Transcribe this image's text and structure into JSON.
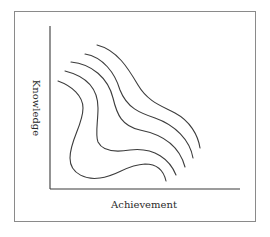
{
  "chart_data": {
    "type": "line",
    "title": "",
    "xlabel": "Achievement",
    "ylabel": "Knowledge",
    "grid": false,
    "legend": "none",
    "series": [
      {
        "name": "curve-1",
        "path": "M58,81 C72,86 83,96 83,108 C83,125 70,140 70,158 C70,175 88,180 100,178 C118,176 125,165 145,164 C158,164 164,172 166,181"
      },
      {
        "name": "curve-2",
        "path": "M65,71 C85,76 98,88 98,108 C98,122 95,135 98,142 C103,152 118,152 130,150 C155,147 170,160 176,175"
      },
      {
        "name": "curve-3",
        "path": "M71,62 C92,64 108,78 113,98 C117,115 122,126 140,130 C165,135 180,148 185,167"
      },
      {
        "name": "curve-4",
        "path": "M85,54 C103,57 115,73 120,90 C127,108 140,113 155,118 C175,125 190,140 193,158"
      },
      {
        "name": "curve-5",
        "path": "M97,45 C117,50 128,68 138,85 C148,102 162,106 175,113 C190,121 198,135 200,148"
      }
    ]
  },
  "axes": {
    "x_label": "Achievement",
    "y_label": "Knowledge"
  }
}
